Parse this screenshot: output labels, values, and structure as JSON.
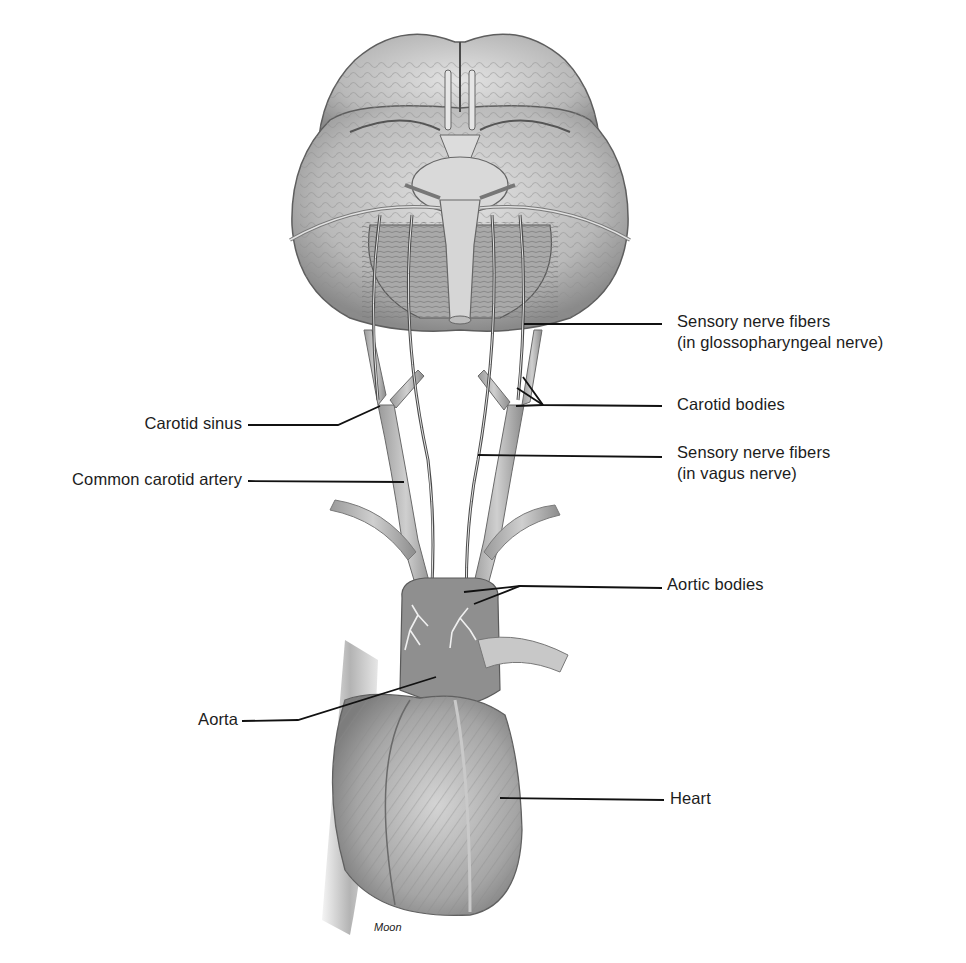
{
  "diagram": {
    "credit": "Moon",
    "colors": {
      "background": "#ffffff",
      "ink": "#1c1c1c",
      "tissue_light": "#d9d9d9",
      "tissue_mid": "#a8a8a8",
      "tissue_dark": "#6e6e6e"
    },
    "labels": {
      "sensory_glosso_line1": "Sensory nerve fibers",
      "sensory_glosso_line2": "(in glossopharyngeal nerve)",
      "carotid_bodies": "Carotid bodies",
      "sensory_vagus_line1": "Sensory nerve fibers",
      "sensory_vagus_line2": "(in vagus nerve)",
      "carotid_sinus": "Carotid sinus",
      "common_carotid_artery": "Common carotid artery",
      "aortic_bodies": "Aortic bodies",
      "aorta": "Aorta",
      "heart": "Heart"
    }
  }
}
